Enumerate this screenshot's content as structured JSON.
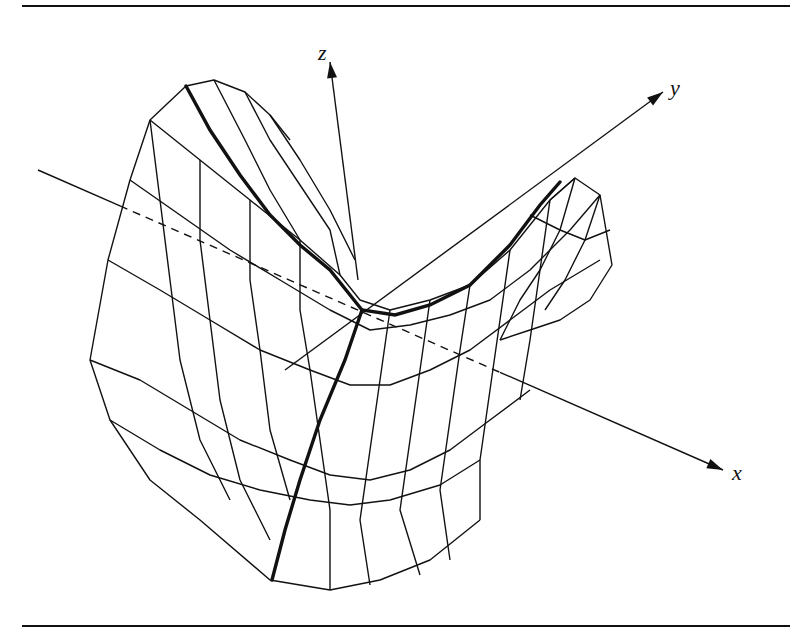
{
  "figure": {
    "width": 790,
    "height": 636,
    "ink_color": "#111111",
    "rules": {
      "top_y": 6,
      "bottom_y": 626,
      "x1": 22,
      "x2": 790
    },
    "axes": [
      {
        "name": "z",
        "label": "z",
        "from": [
          358,
          280
        ],
        "to": [
          330,
          62
        ],
        "label_pos": [
          318,
          40
        ]
      },
      {
        "name": "y",
        "label": "y",
        "from": [
          285,
          370
        ],
        "to": [
          663,
          92
        ],
        "label_pos": [
          670,
          75
        ]
      },
      {
        "name": "x",
        "label": "x",
        "from": [
          38,
          170
        ],
        "to": [
          723,
          470
        ],
        "label_pos": [
          732,
          460
        ],
        "dashed_range": [
          120,
          500
        ]
      }
    ]
  }
}
